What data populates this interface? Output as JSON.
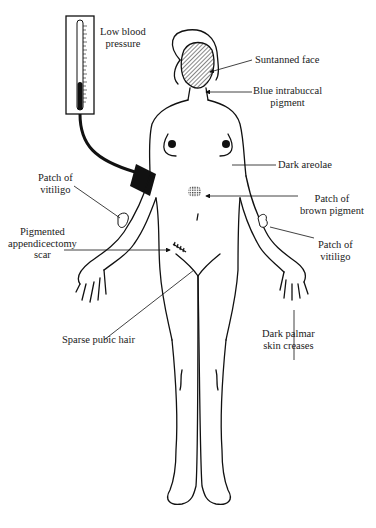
{
  "diagram": {
    "type": "anatomical-annotation",
    "colors": {
      "ink": "#111111",
      "background": "#ffffff"
    },
    "labels": [
      {
        "id": "low-bp",
        "text": "Low blood\npressure"
      },
      {
        "id": "suntanned-face",
        "text": "Suntanned face"
      },
      {
        "id": "intrabuccal",
        "text": "Blue intrabuccal\npigment"
      },
      {
        "id": "areolae",
        "text": "Dark areolae"
      },
      {
        "id": "vitiligo-left",
        "text": "Patch of\nvitiligo"
      },
      {
        "id": "brown-pigment",
        "text": "Patch of\nbrown pigment"
      },
      {
        "id": "scar",
        "text": "Pigmented\nappendicectomy\nscar"
      },
      {
        "id": "vitiligo-right",
        "text": "Patch of\nvitiligo"
      },
      {
        "id": "palmar",
        "text": "Dark palmar\nskin creases"
      },
      {
        "id": "pubic-hair",
        "text": "Sparse pubic hair"
      }
    ]
  }
}
